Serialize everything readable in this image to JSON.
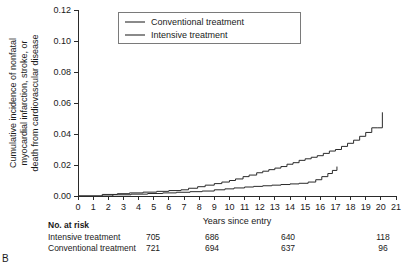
{
  "panel": {
    "label": "B"
  },
  "legend": {
    "position": "top-left-inside",
    "entries": [
      {
        "label": "Conventional treatment",
        "name": "legend-conventional"
      },
      {
        "label": "Intensive treatment",
        "name": "legend-intensive"
      }
    ]
  },
  "risk_table": {
    "title": "No. at risk",
    "row_labels": [
      "Intensive treatment",
      "Conventional treatment"
    ],
    "columns_at_years": [
      0,
      5,
      10,
      15
    ],
    "rows": [
      {
        "label": "Intensive treatment",
        "values": [
          "705",
          "686",
          "640",
          "118"
        ]
      },
      {
        "label": "Conventional treatment",
        "values": [
          "721",
          "694",
          "637",
          "96"
        ]
      }
    ]
  },
  "chart_data": {
    "type": "line",
    "subtype": "kaplan-meier-cumulative-incidence-step",
    "title": "",
    "xlabel": "Years since entry",
    "ylabel": "Cumulative incidence of nonfatal myocardial infarction, stroke, or death from cardiovascular disease",
    "ylabel_lines": [
      "Cumulative incidence of nonfatal",
      "myocardial infarction, stroke, or",
      "death from cardiovascular disease"
    ],
    "xlim": [
      0,
      21
    ],
    "ylim": [
      0,
      0.12
    ],
    "xticks": [
      0,
      1,
      2,
      3,
      4,
      5,
      6,
      7,
      8,
      9,
      10,
      11,
      12,
      13,
      14,
      15,
      16,
      17,
      18,
      19,
      20,
      21
    ],
    "xticklabels": [
      "0",
      "1",
      "2",
      "3",
      "4",
      "5",
      "6",
      "7",
      "8",
      "9",
      "10",
      "11",
      "12",
      "13",
      "14",
      "15",
      "16",
      "17",
      "18",
      "19",
      "20",
      "21"
    ],
    "yticks": [
      0.0,
      0.02,
      0.04,
      0.06,
      0.08,
      0.1,
      0.12
    ],
    "yticklabels": [
      "0.00",
      "0.02",
      "0.04",
      "0.06",
      "0.08",
      "0.10",
      "0.12"
    ],
    "grid": false,
    "colors": {
      "conventional": "#2a2a2a",
      "intensive": "#2a2a2a"
    },
    "series": [
      {
        "name": "Conventional treatment",
        "x": [
          0,
          1.6,
          2.6,
          3.4,
          4.3,
          5.2,
          6.0,
          6.8,
          7.3,
          7.9,
          8.4,
          9.0,
          9.5,
          10.0,
          10.4,
          10.9,
          11.3,
          11.8,
          12.2,
          12.6,
          13.0,
          13.4,
          13.8,
          14.2,
          14.6,
          15.0,
          15.4,
          15.8,
          16.2,
          16.6,
          17.0,
          17.4,
          17.8,
          18.2,
          18.6,
          19.0,
          19.4,
          19.8,
          20.1
        ],
        "y": [
          0.0,
          0.001,
          0.0015,
          0.002,
          0.0025,
          0.003,
          0.0035,
          0.004,
          0.005,
          0.006,
          0.007,
          0.008,
          0.009,
          0.01,
          0.011,
          0.0125,
          0.0135,
          0.015,
          0.016,
          0.017,
          0.018,
          0.019,
          0.0205,
          0.0215,
          0.023,
          0.024,
          0.025,
          0.026,
          0.0275,
          0.029,
          0.03,
          0.032,
          0.034,
          0.036,
          0.0385,
          0.041,
          0.044,
          0.044,
          0.054
        ],
        "end_value": 0.054
      },
      {
        "name": "Intensive treatment",
        "x": [
          0,
          2.3,
          3.5,
          4.6,
          5.6,
          6.5,
          7.4,
          8.2,
          9.0,
          9.7,
          10.3,
          11.0,
          11.6,
          12.2,
          12.8,
          13.4,
          14.0,
          14.6,
          15.2,
          15.7,
          16.1,
          16.5,
          16.8,
          17.1
        ],
        "y": [
          0.0,
          0.0008,
          0.0012,
          0.0016,
          0.002,
          0.0024,
          0.0028,
          0.0032,
          0.004,
          0.0046,
          0.0052,
          0.0058,
          0.0062,
          0.0066,
          0.007,
          0.0074,
          0.0078,
          0.0082,
          0.009,
          0.0105,
          0.0125,
          0.0145,
          0.0165,
          0.019
        ],
        "end_value": 0.019
      }
    ]
  }
}
